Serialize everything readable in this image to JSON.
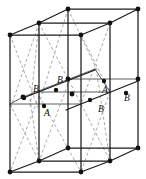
{
  "figure": {
    "colors": {
      "solid_edge": "#1b1b1b",
      "thin_edge": "#4a4a4a",
      "dashed_edge": "#9a9a9a",
      "node": "#111111",
      "background": "#ffffff"
    }
  },
  "site_labels": [
    {
      "id": "label-b-upper-left",
      "text": "B",
      "x": 36,
      "y": 92
    },
    {
      "id": "label-b-upper-mid",
      "text": "B",
      "x": 60,
      "y": 83
    },
    {
      "id": "label-a-mid-right",
      "text": "A",
      "x": 105,
      "y": 93
    },
    {
      "id": "label-b-right",
      "text": "B",
      "x": 127,
      "y": 101
    },
    {
      "id": "label-a-front-left",
      "text": "A",
      "x": 47,
      "y": 116
    },
    {
      "id": "label-b-front-mid",
      "text": "B",
      "x": 101,
      "y": 112
    }
  ],
  "nodes": [
    {
      "id": "corner-top-back-left",
      "x": 68,
      "y": 9,
      "r": 2.4,
      "kind": "corner"
    },
    {
      "id": "corner-top-back-right",
      "x": 138,
      "y": 9,
      "r": 2.4,
      "kind": "corner"
    },
    {
      "id": "corner-top-mid-left",
      "x": 39,
      "y": 23,
      "r": 2.4,
      "kind": "corner"
    },
    {
      "id": "corner-top-mid-right",
      "x": 110,
      "y": 23,
      "r": 2.4,
      "kind": "corner"
    },
    {
      "id": "corner-top-front-left",
      "x": 10,
      "y": 35,
      "r": 2.4,
      "kind": "corner"
    },
    {
      "id": "corner-top-front-mid",
      "x": 81,
      "y": 35,
      "r": 2.4,
      "kind": "corner"
    },
    {
      "id": "corner-mid-back-left",
      "x": 68,
      "y": 79,
      "r": 2.4,
      "kind": "corner"
    },
    {
      "id": "corner-mid-back-right",
      "x": 138,
      "y": 79,
      "r": 2.4,
      "kind": "corner"
    },
    {
      "id": "corner-mid-left",
      "x": 23,
      "y": 97,
      "r": 2.4,
      "kind": "corner"
    },
    {
      "id": "corner-mid-center",
      "x": 72,
      "y": 94,
      "r": 2.4,
      "kind": "corner"
    },
    {
      "id": "corner-bot-back-left",
      "x": 68,
      "y": 148,
      "r": 2.4,
      "kind": "corner"
    },
    {
      "id": "corner-bot-back-right",
      "x": 138,
      "y": 148,
      "r": 2.4,
      "kind": "corner"
    },
    {
      "id": "corner-bot-mid-left",
      "x": 39,
      "y": 161,
      "r": 2.4,
      "kind": "corner"
    },
    {
      "id": "corner-bot-mid-right",
      "x": 110,
      "y": 161,
      "r": 2.4,
      "kind": "corner"
    },
    {
      "id": "corner-bot-front-left",
      "x": 10,
      "y": 172,
      "r": 2.4,
      "kind": "corner"
    },
    {
      "id": "corner-bot-front-mid",
      "x": 81,
      "y": 172,
      "r": 2.4,
      "kind": "corner"
    },
    {
      "id": "site-b-upper-left",
      "x": 24,
      "y": 98,
      "r": 2.2,
      "kind": "site-b"
    },
    {
      "id": "site-b-upper-mid",
      "x": 56,
      "y": 90,
      "r": 2.2,
      "kind": "site-b"
    },
    {
      "id": "site-a-mid-right",
      "x": 104,
      "y": 81,
      "r": 2.2,
      "kind": "site-a"
    },
    {
      "id": "site-b-right",
      "x": 126,
      "y": 93,
      "r": 2.2,
      "kind": "site-b"
    },
    {
      "id": "site-a-front-left",
      "x": 44,
      "y": 106,
      "r": 2.2,
      "kind": "site-a"
    },
    {
      "id": "site-b-front-mid",
      "x": 90,
      "y": 100,
      "r": 2.2,
      "kind": "site-b"
    },
    {
      "id": "site-center-plane",
      "x": 72,
      "y": 94,
      "r": 2.2,
      "kind": "site-a"
    }
  ],
  "solid_edges": [
    {
      "id": "top-back-left-to-right",
      "x1": 68,
      "y1": 9,
      "x2": 138,
      "y2": 9
    },
    {
      "id": "top-back-left-to-midleft",
      "x1": 68,
      "y1": 9,
      "x2": 39,
      "y2": 23
    },
    {
      "id": "top-back-right-to-midrt",
      "x1": 138,
      "y1": 9,
      "x2": 110,
      "y2": 23
    },
    {
      "id": "top-midleft-to-midright",
      "x1": 39,
      "y1": 23,
      "x2": 110,
      "y2": 23
    },
    {
      "id": "top-midleft-to-frontleft",
      "x1": 39,
      "y1": 23,
      "x2": 10,
      "y2": 35
    },
    {
      "id": "top-midright-to-frontmid",
      "x1": 110,
      "y1": 23,
      "x2": 81,
      "y2": 35
    },
    {
      "id": "top-frontleft-to-frontmid",
      "x1": 10,
      "y1": 35,
      "x2": 81,
      "y2": 35
    },
    {
      "id": "vert-back-left",
      "x1": 68,
      "y1": 9,
      "x2": 68,
      "y2": 148
    },
    {
      "id": "vert-back-right",
      "x1": 138,
      "y1": 9,
      "x2": 138,
      "y2": 148
    },
    {
      "id": "vert-mid-left",
      "x1": 39,
      "y1": 23,
      "x2": 39,
      "y2": 161
    },
    {
      "id": "vert-mid-right",
      "x1": 110,
      "y1": 23,
      "x2": 110,
      "y2": 161
    },
    {
      "id": "vert-front-left",
      "x1": 10,
      "y1": 35,
      "x2": 10,
      "y2": 172
    },
    {
      "id": "vert-front-mid",
      "x1": 81,
      "y1": 35,
      "x2": 81,
      "y2": 172
    },
    {
      "id": "bot-back-left-to-right",
      "x1": 68,
      "y1": 148,
      "x2": 138,
      "y2": 148
    },
    {
      "id": "bot-back-left-to-midleft",
      "x1": 68,
      "y1": 148,
      "x2": 39,
      "y2": 161
    },
    {
      "id": "bot-back-right-to-midrt",
      "x1": 138,
      "y1": 148,
      "x2": 110,
      "y2": 161
    },
    {
      "id": "bot-midleft-to-midright",
      "x1": 39,
      "y1": 161,
      "x2": 110,
      "y2": 161
    },
    {
      "id": "bot-midleft-to-frontleft",
      "x1": 39,
      "y1": 161,
      "x2": 10,
      "y2": 172
    },
    {
      "id": "bot-midright-to-frontmid",
      "x1": 110,
      "y1": 161,
      "x2": 81,
      "y2": 172
    },
    {
      "id": "bot-frontleft-to-frontmid",
      "x1": 10,
      "y1": 172,
      "x2": 81,
      "y2": 172
    },
    {
      "id": "mid-diag-left-lower",
      "x1": 23,
      "y1": 98,
      "x2": 95,
      "y2": 70
    },
    {
      "id": "mid-diag-right-lower",
      "x1": 66,
      "y1": 110,
      "x2": 138,
      "y2": 81
    }
  ],
  "thin_edges": [
    {
      "id": "mid-back-left-to-right",
      "x1": 68,
      "y1": 79,
      "x2": 138,
      "y2": 79
    },
    {
      "id": "mid-plane-left-edge",
      "x1": 23,
      "y1": 97,
      "x2": 95,
      "y2": 69
    },
    {
      "id": "mid-plane-front-edge",
      "x1": 10,
      "y1": 104,
      "x2": 81,
      "y2": 104
    },
    {
      "id": "mid-plane-rear-edge",
      "x1": 39,
      "y1": 92,
      "x2": 110,
      "y2": 92
    },
    {
      "id": "mid-plane-vert-a",
      "x1": 23,
      "y1": 97,
      "x2": 10,
      "y2": 104
    },
    {
      "id": "mid-plane-vert-b",
      "x1": 95,
      "y1": 69,
      "x2": 110,
      "y2": 92
    }
  ],
  "dashed_edges": [
    {
      "id": "diag-upper-left-a",
      "x1": 10,
      "y1": 35,
      "x2": 39,
      "y2": 110
    },
    {
      "id": "diag-upper-left-b",
      "x1": 39,
      "y1": 23,
      "x2": 10,
      "y2": 110
    },
    {
      "id": "diag-upper-left-c",
      "x1": 39,
      "y1": 23,
      "x2": 30,
      "y2": 108
    },
    {
      "id": "diag-upper-mid-a",
      "x1": 39,
      "y1": 23,
      "x2": 81,
      "y2": 104
    },
    {
      "id": "diag-upper-mid-b",
      "x1": 68,
      "y1": 9,
      "x2": 39,
      "y2": 104
    },
    {
      "id": "diag-upper-right-a",
      "x1": 81,
      "y1": 35,
      "x2": 110,
      "y2": 92
    },
    {
      "id": "diag-upper-right-b",
      "x1": 110,
      "y1": 23,
      "x2": 81,
      "y2": 104
    },
    {
      "id": "diag-upper-right-c",
      "x1": 68,
      "y1": 9,
      "x2": 97,
      "y2": 70
    },
    {
      "id": "diag-lower-left-a",
      "x1": 10,
      "y1": 104,
      "x2": 39,
      "y2": 161
    },
    {
      "id": "diag-lower-left-b",
      "x1": 39,
      "y1": 96,
      "x2": 10,
      "y2": 172
    },
    {
      "id": "diag-lower-left-c",
      "x1": 30,
      "y1": 99,
      "x2": 39,
      "y2": 161
    },
    {
      "id": "diag-lower-mid-a",
      "x1": 39,
      "y1": 96,
      "x2": 81,
      "y2": 172
    },
    {
      "id": "diag-lower-mid-b",
      "x1": 68,
      "y1": 84,
      "x2": 39,
      "y2": 161
    },
    {
      "id": "diag-lower-right-a",
      "x1": 81,
      "y1": 104,
      "x2": 110,
      "y2": 161
    },
    {
      "id": "diag-lower-right-b",
      "x1": 110,
      "y1": 92,
      "x2": 81,
      "y2": 172
    },
    {
      "id": "diag-lower-right-c",
      "x1": 97,
      "y1": 74,
      "x2": 110,
      "y2": 161
    }
  ]
}
